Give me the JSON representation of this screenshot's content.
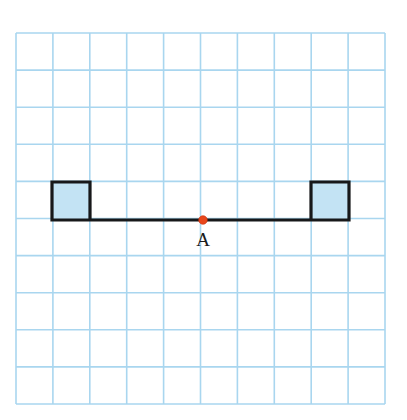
{
  "figure": {
    "background_color": "#ffffff",
    "canvas": {
      "width": 407,
      "height": 420
    }
  },
  "grid": {
    "name": "graph-paper-grid",
    "columns": 10,
    "rows": 10,
    "origin_x": 16,
    "origin_y": 33,
    "cell_width": 36.9,
    "cell_height": 37.1,
    "line_color_major": "#a9d6ef",
    "line_color_minor": "#cfe8f7"
  },
  "shape": {
    "name": "channel-beam",
    "description": "U-shaped channel: two square end blocks joined by a horizontal web",
    "outline_color": "#17181a",
    "outline_width": 3.2,
    "fill_color": "#c3e3f4",
    "left_block": {
      "x": 52,
      "y": 182,
      "width": 38,
      "height": 38
    },
    "right_block": {
      "x": 311,
      "y": 182,
      "width": 38,
      "height": 38
    },
    "web": {
      "x1": 52,
      "y1": 220,
      "x2": 349,
      "y2": 220
    }
  },
  "points": [
    {
      "id": "A",
      "label": "A",
      "x": 203,
      "y": 220,
      "radius": 4.3,
      "color": "#e8471c",
      "label_x": 203,
      "label_y": 246
    }
  ],
  "chart_data": {
    "type": "scatter",
    "title": "",
    "xlabel": "",
    "ylabel": "",
    "grid": true,
    "legend": "none",
    "xlim": [
      0,
      10
    ],
    "ylim": [
      0,
      10
    ],
    "grid_units": {
      "x_cells": 10,
      "y_cells": 10
    },
    "annotations": [
      {
        "text": "A",
        "grid_x": 5.06,
        "grid_y": 5.0,
        "marker": "red-dot"
      }
    ],
    "shapes": [
      {
        "name": "left-square",
        "type": "rectangle",
        "grid_x": 0.98,
        "grid_y": 4.0,
        "grid_width": 1.03,
        "grid_height": 1.02,
        "fill": "#c3e3f4",
        "stroke": "#17181a"
      },
      {
        "name": "right-square",
        "type": "rectangle",
        "grid_x": 7.99,
        "grid_y": 4.0,
        "grid_width": 1.03,
        "grid_height": 1.02,
        "fill": "#c3e3f4",
        "stroke": "#17181a"
      },
      {
        "name": "connecting-web",
        "type": "line",
        "grid_x1": 0.98,
        "grid_y1": 5.0,
        "grid_x2": 9.02,
        "grid_y2": 5.0,
        "stroke": "#17181a"
      }
    ]
  }
}
